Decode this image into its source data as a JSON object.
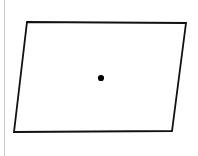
{
  "figure": {
    "canvas": {
      "width": 198,
      "height": 156,
      "background_color": "#ffffff"
    },
    "shape": {
      "name": "parallelogram",
      "type": "polygon",
      "stroke_color": "#111111",
      "stroke_width": 1.8,
      "fill_color": "none",
      "points": "27,22 186,23 172,131 14,132",
      "vertices": [
        {
          "label": "top-left",
          "x": 27,
          "y": 22
        },
        {
          "label": "top-right",
          "x": 186,
          "y": 23
        },
        {
          "label": "bottom-right",
          "x": 172,
          "y": 131
        },
        {
          "label": "bottom-left",
          "x": 14,
          "y": 132
        }
      ]
    },
    "center_point": {
      "name": "center-dot",
      "x": 101,
      "y": 78,
      "radius": 3.1,
      "color": "#000000"
    },
    "edge_artifact": {
      "name": "left-margin-line",
      "x": 4.5,
      "y1": 0,
      "y2": 156,
      "color": "#c8c8c8",
      "stroke_width": 1
    }
  }
}
